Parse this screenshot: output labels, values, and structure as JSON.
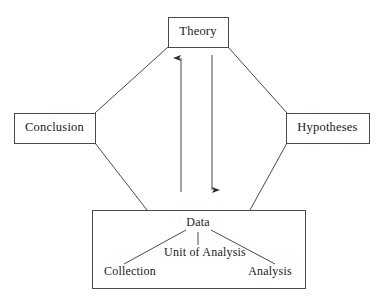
{
  "diagram": {
    "background_color": "#ffffff",
    "line_color": "#3c3c3c",
    "text_color": "#1a1a1a",
    "nodes": {
      "theory": {
        "label": "Theory",
        "x": 168,
        "y": 17,
        "w": 60,
        "h": 30
      },
      "conclusion": {
        "label": "Conclusion",
        "x": 14,
        "y": 113,
        "w": 81,
        "h": 30
      },
      "hypotheses": {
        "label": "Hypotheses",
        "x": 286,
        "y": 113,
        "w": 83,
        "h": 30
      },
      "data_box": {
        "label": "Data",
        "x": 92,
        "y": 210,
        "w": 213,
        "h": 78
      }
    },
    "inner_nodes": {
      "data": {
        "label": "Data",
        "cx": 198,
        "cy": 222
      },
      "unit_of_analysis": {
        "label": "Unit of Analysis",
        "cx": 205,
        "cy": 253
      },
      "collection": {
        "label": "Collection",
        "cx": 130,
        "cy": 272
      },
      "analysis": {
        "label": "Analysis",
        "cx": 270,
        "cy": 272
      }
    },
    "arrows": [
      {
        "name": "data-to-theory",
        "direction": "up",
        "x": 181,
        "y_from": 192,
        "y_to": 55
      },
      {
        "name": "theory-to-data",
        "direction": "down",
        "x": 212,
        "y_from": 55,
        "y_to": 192
      }
    ],
    "connectors": [
      {
        "name": "theory-conclusion",
        "from": "theory",
        "to": "conclusion"
      },
      {
        "name": "conclusion-data",
        "from": "conclusion",
        "to": "data_box"
      },
      {
        "name": "theory-hypotheses",
        "from": "theory",
        "to": "hypotheses"
      },
      {
        "name": "hypotheses-data",
        "from": "hypotheses",
        "to": "data_box"
      }
    ],
    "inner_connectors": [
      {
        "name": "data-collection-branch"
      },
      {
        "name": "data-unit-branch"
      },
      {
        "name": "data-analysis-branch"
      }
    ]
  }
}
